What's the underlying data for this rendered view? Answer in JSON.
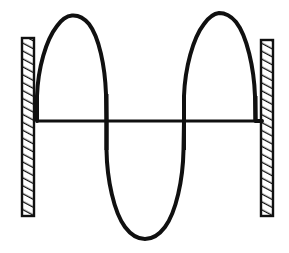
{
  "figure": {
    "canvas": {
      "width": 289,
      "height": 253,
      "background": "#ffffff"
    },
    "stroke_color": "#101010",
    "hatch_color": "#101010"
  },
  "axis": {
    "label": "equilibrium-axis",
    "x_start": 36,
    "x_end": 263,
    "y": 121,
    "thickness": 3
  },
  "walls": {
    "left": {
      "label": "left-fixed-support",
      "x": 22,
      "y": 38,
      "width": 12,
      "height": 178,
      "hatch_angle_deg": 62,
      "hatch_spacing": 7
    },
    "right": {
      "label": "right-fixed-support",
      "x": 261,
      "y": 40,
      "width": 12,
      "height": 176,
      "hatch_angle_deg": 62,
      "hatch_spacing": 7
    }
  },
  "wave": {
    "label": "standing-wave-curve",
    "stroke_width": 4,
    "nodes_x": [
      37,
      107,
      184,
      262
    ],
    "crest_peak_y": [
      15,
      13
    ],
    "trough_bottom_y": 238,
    "amplitude_up": 106,
    "amplitude_down": 117,
    "wavelengths": 1.5,
    "path": "M 37,121 L 37,96 C 38,68 46,40 57,26 C 62,19 67,16 72,15.5 C 78,15 84,18 89,24 C 99,37 105,66 106,94 L 106.5,121 L 106.5,150 C 107,180 114,212 125,227 C 131,235 138,239 145,239 C 152,239 159,235 165,227 C 176,212 183,180 183.5,150 L 184,121 L 184,96 C 185,68 193,38 204,24 C 209,17 214,13.5 219,13 C 225,13 231,16 236,22 C 247,36 254,68 255,96 L 255.5,121 L 262,121",
    "description": "Two upward loops separated by one downward loop; curve is fixed (zero displacement) at both walls and at two interior nodes."
  },
  "chart_data": {
    "type": "line",
    "xlabel": "",
    "ylabel": "",
    "xlim": [
      37,
      262
    ],
    "ylim": [
      -117,
      106
    ],
    "grid": false,
    "legend": false,
    "annotations": [
      {
        "name": "left-fixed-support",
        "x": 28,
        "y": 0,
        "text": "hatched wall"
      },
      {
        "name": "right-fixed-support",
        "x": 267,
        "y": 0,
        "text": "hatched wall"
      }
    ],
    "series": [
      {
        "name": "standing-wave",
        "x": [
          37,
          72,
          107,
          145,
          184,
          219,
          262
        ],
        "y": [
          0,
          106,
          0,
          -117,
          0,
          108,
          0
        ],
        "shape": "three-loop standing wave (1.5 wavelengths)"
      },
      {
        "name": "equilibrium-axis",
        "x": [
          37,
          262
        ],
        "y": [
          0,
          0
        ],
        "shape": "straight horizontal line"
      }
    ]
  }
}
